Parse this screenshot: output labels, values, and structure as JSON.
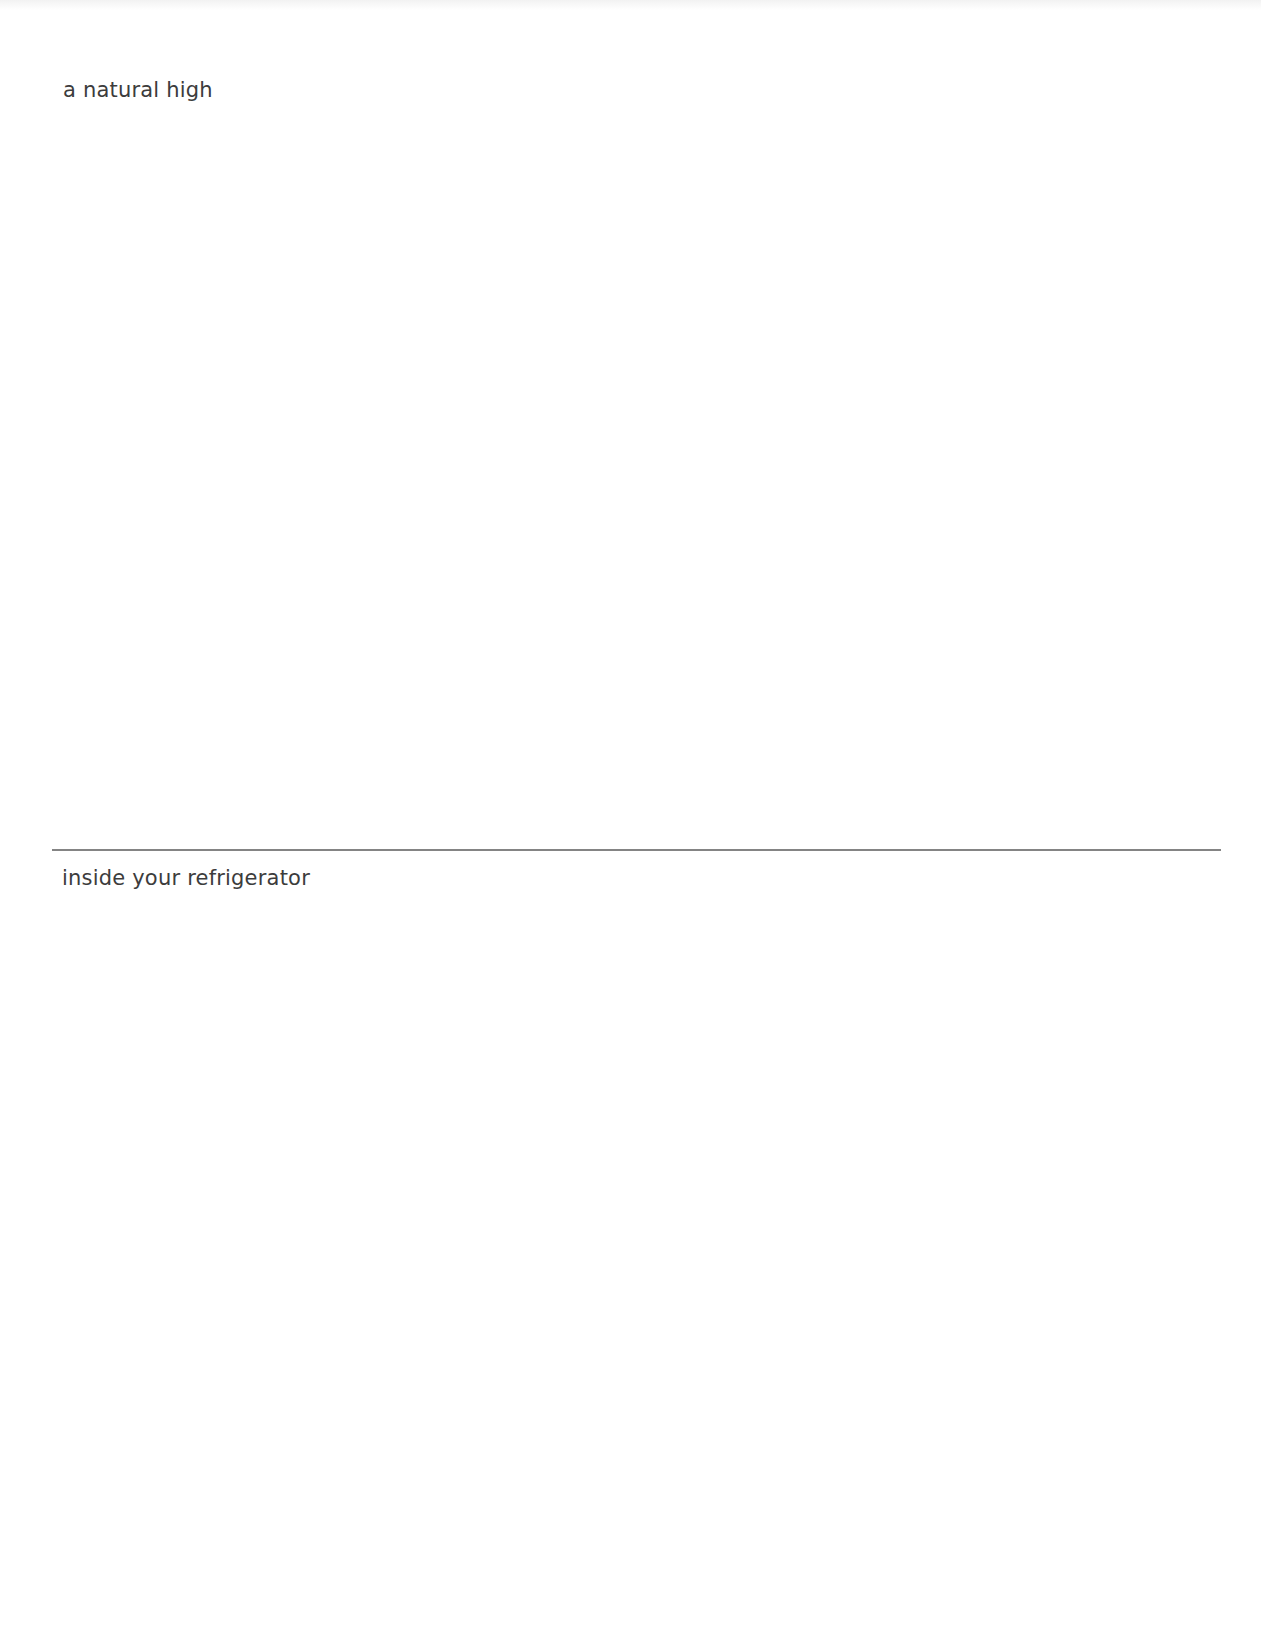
{
  "document": {
    "sections": [
      {
        "label": "a natural high"
      },
      {
        "label": "inside your refrigerator"
      }
    ]
  },
  "colors": {
    "text": "#3c3c3c",
    "divider": "#6e6e6e",
    "background": "#ffffff"
  }
}
